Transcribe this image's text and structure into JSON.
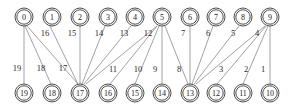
{
  "diagram": {
    "kind": "bipartite-graph",
    "background_color": "#ffffff",
    "node_fill": "#ffffff",
    "node_stroke": "#3a3a3a",
    "edge_stroke": "#8a8a8a",
    "label_color": "#1a1a1a",
    "top_row": {
      "y": 17,
      "nodes": [
        {
          "id": "n0",
          "label": "0",
          "x": 24,
          "y": 17,
          "r": 9
        },
        {
          "id": "n1",
          "label": "1",
          "x": 52,
          "y": 17,
          "r": 9
        },
        {
          "id": "n2",
          "label": "2",
          "x": 80,
          "y": 17,
          "r": 9
        },
        {
          "id": "n3",
          "label": "3",
          "x": 108,
          "y": 17,
          "r": 9
        },
        {
          "id": "n4",
          "label": "4",
          "x": 135,
          "y": 17,
          "r": 9
        },
        {
          "id": "n5",
          "label": "5",
          "x": 162,
          "y": 17,
          "r": 9
        },
        {
          "id": "n6",
          "label": "6",
          "x": 190,
          "y": 17,
          "r": 9
        },
        {
          "id": "n7",
          "label": "7",
          "x": 216,
          "y": 17,
          "r": 9
        },
        {
          "id": "n8",
          "label": "8",
          "x": 243,
          "y": 17,
          "r": 9
        },
        {
          "id": "n9",
          "label": "9",
          "x": 270,
          "y": 17,
          "r": 9
        }
      ]
    },
    "bottom_row": {
      "y": 93,
      "nodes": [
        {
          "id": "n19",
          "label": "19",
          "x": 24,
          "y": 93,
          "r": 9
        },
        {
          "id": "n18",
          "label": "18",
          "x": 52,
          "y": 93,
          "r": 9
        },
        {
          "id": "n17",
          "label": "17",
          "x": 80,
          "y": 93,
          "r": 9
        },
        {
          "id": "n16",
          "label": "16",
          "x": 108,
          "y": 93,
          "r": 9
        },
        {
          "id": "n15",
          "label": "15",
          "x": 135,
          "y": 93,
          "r": 9
        },
        {
          "id": "n14",
          "label": "14",
          "x": 162,
          "y": 93,
          "r": 9
        },
        {
          "id": "n13",
          "label": "13",
          "x": 190,
          "y": 93,
          "r": 9
        },
        {
          "id": "n12",
          "label": "12",
          "x": 216,
          "y": 93,
          "r": 9
        },
        {
          "id": "n11",
          "label": "11",
          "x": 243,
          "y": 93,
          "r": 9
        },
        {
          "id": "n10",
          "label": "10",
          "x": 270,
          "y": 93,
          "r": 9
        }
      ]
    },
    "edges": [
      {
        "id": "e19",
        "label": "19",
        "from": "n0",
        "to": "n19",
        "x1": 24,
        "y1": 26,
        "x2": 24,
        "y2": 84,
        "lx": 17,
        "ly": 68
      },
      {
        "id": "e18",
        "label": "18",
        "from": "n0",
        "to": "n18",
        "x1": 25,
        "y1": 26,
        "x2": 51,
        "y2": 84,
        "lx": 41,
        "ly": 68
      },
      {
        "id": "e17",
        "label": "17",
        "from": "n0",
        "to": "n17",
        "x1": 27,
        "y1": 26,
        "x2": 78,
        "y2": 84,
        "lx": 63,
        "ly": 68
      },
      {
        "id": "e16",
        "label": "16",
        "from": "n1",
        "to": "n17",
        "x1": 50,
        "y1": 26,
        "x2": 78,
        "y2": 84,
        "lx": 45,
        "ly": 33
      },
      {
        "id": "e15",
        "label": "15",
        "from": "n2",
        "to": "n17",
        "x1": 80,
        "y1": 26,
        "x2": 80,
        "y2": 84,
        "lx": 72,
        "ly": 33
      },
      {
        "id": "e14",
        "label": "14",
        "from": "n3",
        "to": "n17",
        "x1": 105,
        "y1": 26,
        "x2": 82,
        "y2": 84,
        "lx": 99,
        "ly": 33
      },
      {
        "id": "e13",
        "label": "13",
        "from": "n4",
        "to": "n17",
        "x1": 131,
        "y1": 26,
        "x2": 84,
        "y2": 84,
        "lx": 124,
        "ly": 33
      },
      {
        "id": "e12",
        "label": "12",
        "from": "n5",
        "to": "n17",
        "x1": 157,
        "y1": 26,
        "x2": 86,
        "y2": 84,
        "lx": 148,
        "ly": 33
      },
      {
        "id": "e11",
        "label": "11",
        "from": "n5",
        "to": "n16",
        "x1": 157,
        "y1": 26,
        "x2": 110,
        "y2": 84,
        "lx": 113,
        "ly": 69
      },
      {
        "id": "e10",
        "label": "10",
        "from": "n5",
        "to": "n15",
        "x1": 159,
        "y1": 26,
        "x2": 135,
        "y2": 84,
        "lx": 138,
        "ly": 69
      },
      {
        "id": "e9",
        "label": "9",
        "from": "n5",
        "to": "n14",
        "x1": 162,
        "y1": 26,
        "x2": 162,
        "y2": 84,
        "lx": 155,
        "ly": 69
      },
      {
        "id": "e8",
        "label": "8",
        "from": "n5",
        "to": "n13",
        "x1": 165,
        "y1": 26,
        "x2": 188,
        "y2": 84,
        "lx": 179,
        "ly": 69
      },
      {
        "id": "e7",
        "label": "7",
        "from": "n6",
        "to": "n13",
        "x1": 190,
        "y1": 26,
        "x2": 190,
        "y2": 84,
        "lx": 183,
        "ly": 33
      },
      {
        "id": "e6",
        "label": "6",
        "from": "n7",
        "to": "n13",
        "x1": 213,
        "y1": 26,
        "x2": 192,
        "y2": 84,
        "lx": 208,
        "ly": 33
      },
      {
        "id": "e5",
        "label": "5",
        "from": "n8",
        "to": "n13",
        "x1": 239,
        "y1": 26,
        "x2": 194,
        "y2": 84,
        "lx": 233,
        "ly": 33
      },
      {
        "id": "e4",
        "label": "4",
        "from": "n9",
        "to": "n13",
        "x1": 265,
        "y1": 26,
        "x2": 196,
        "y2": 84,
        "lx": 257,
        "ly": 33
      },
      {
        "id": "e3",
        "label": "3",
        "from": "n9",
        "to": "n12",
        "x1": 266,
        "y1": 26,
        "x2": 217,
        "y2": 84,
        "lx": 221,
        "ly": 69
      },
      {
        "id": "e2",
        "label": "2",
        "from": "n9",
        "to": "n11",
        "x1": 268,
        "y1": 26,
        "x2": 243,
        "y2": 84,
        "lx": 246,
        "ly": 69
      },
      {
        "id": "e1",
        "label": "1",
        "from": "n9",
        "to": "n10",
        "x1": 270,
        "y1": 26,
        "x2": 270,
        "y2": 84,
        "lx": 263,
        "ly": 69
      }
    ]
  }
}
